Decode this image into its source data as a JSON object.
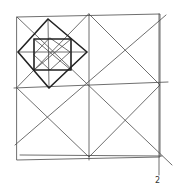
{
  "figure": {
    "label": "2",
    "stroke_color": "#4a4a4a",
    "bold_stroke_color": "#222222",
    "outer_square": [
      [
        17,
        17
      ],
      [
        160,
        14
      ],
      [
        160,
        157
      ],
      [
        17,
        160
      ]
    ],
    "lines": [
      {
        "name": "vertical-midline",
        "from": [
          89,
          14
        ],
        "to": [
          89,
          160
        ]
      },
      {
        "name": "horizontal-midline",
        "from": [
          14,
          88
        ],
        "to": [
          168,
          82
        ]
      },
      {
        "name": "diagonal-main",
        "from": [
          17,
          17
        ],
        "to": [
          172,
          165
        ]
      },
      {
        "name": "diagonal-anti",
        "from": [
          15,
          145
        ],
        "to": [
          166,
          15
        ]
      },
      {
        "name": "right-vertical",
        "from": [
          159,
          14
        ],
        "to": [
          159,
          175
        ]
      },
      {
        "name": "bottom-line",
        "from": [
          20,
          155
        ],
        "to": [
          162,
          156
        ]
      }
    ],
    "mid_diamond": [
      [
        89,
        14
      ],
      [
        160,
        85
      ],
      [
        89,
        157
      ],
      [
        17,
        88
      ]
    ],
    "upper_left_diamond": [
      [
        48,
        19
      ],
      [
        87,
        52
      ],
      [
        49,
        88
      ],
      [
        18,
        52
      ]
    ],
    "inner_square": [
      [
        34,
        39
      ],
      [
        71,
        39
      ],
      [
        71,
        70
      ],
      [
        34,
        70
      ]
    ],
    "inner_diamond": [
      [
        50,
        38
      ],
      [
        70,
        52
      ],
      [
        50,
        70
      ],
      [
        34,
        55
      ]
    ]
  }
}
